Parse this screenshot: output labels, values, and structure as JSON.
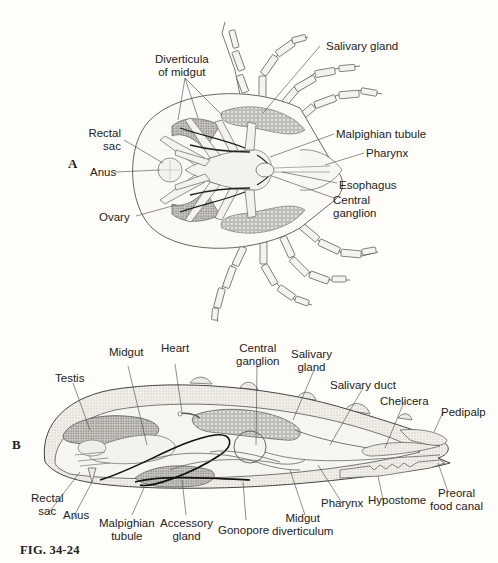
{
  "figure": {
    "caption": "FIG. 34-24",
    "background": "#fffefa",
    "ink_color": "#222222",
    "panels": {
      "A": {
        "label": "A",
        "view": "dorsal view of tick internal anatomy",
        "labels": {
          "diverticula_of_midgut": "Diverticula\nof midgut",
          "diverticula_line1": "Diverticula",
          "diverticula_line2": "of midgut",
          "salivary_gland": "Salivary gland",
          "rectal_sac_line1": "Rectal",
          "rectal_sac_line2": "sac",
          "anus": "Anus",
          "malpighian_tubule": "Malpighian tubule",
          "pharynx": "Pharynx",
          "ovary": "Ovary",
          "esophagus": "Esophagus",
          "central_ganglion_line1": "Central",
          "central_ganglion_line2": "ganglion"
        }
      },
      "B": {
        "label": "B",
        "view": "lateral section of tick internal anatomy",
        "labels": {
          "midgut": "Midgut",
          "heart": "Heart",
          "central_ganglion_line1": "Central",
          "central_ganglion_line2": "ganglion",
          "salivary_gland_line1": "Salivary",
          "salivary_gland_line2": "gland",
          "testis": "Testis",
          "salivary_duct": "Salivary duct",
          "chelicera": "Chelicera",
          "pedipalp": "Pedipalp",
          "rectal_sac_line1": "Rectal",
          "rectal_sac_line2": "sac",
          "anus": "Anus",
          "malpighian_tubule_line1": "Malpighian",
          "malpighian_tubule_line2": "tubule",
          "accessory_gland_line1": "Accessory",
          "accessory_gland_line2": "gland",
          "gonopore": "Gonopore",
          "midgut_diverticulum_line1": "Midgut",
          "midgut_diverticulum_line2": "diverticulum",
          "pharynx": "Pharynx",
          "hypostome": "Hypostome",
          "preoral_food_canal_line1": "Preoral",
          "preoral_food_canal_line2": "food canal"
        }
      }
    }
  }
}
